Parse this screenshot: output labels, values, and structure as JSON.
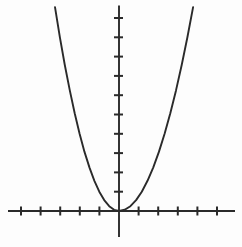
{
  "figure": {
    "background_color": "#fdfdfd",
    "line_color": "#2a2a2a"
  },
  "chart_data": {
    "type": "line",
    "title": "",
    "xlabel": "",
    "ylabel": "",
    "grid": false,
    "legend_shown": false,
    "tick_labels_shown": false,
    "function": "y = x^2",
    "xlim": [
      -5.7,
      5.9
    ],
    "ylim": [
      -1.35,
      10.65
    ],
    "x_ticks": [
      -5,
      -4,
      -3,
      -2,
      -1,
      1,
      2,
      3,
      4,
      5
    ],
    "y_ticks": [
      1,
      2,
      3,
      4,
      5,
      6,
      7,
      8,
      9,
      10
    ],
    "series": [
      {
        "name": "y = x^2",
        "points": [
          [
            -3.25,
            10.5625
          ],
          [
            -3.0,
            9.0
          ],
          [
            -2.75,
            7.5625
          ],
          [
            -2.5,
            6.25
          ],
          [
            -2.25,
            5.0625
          ],
          [
            -2.0,
            4.0
          ],
          [
            -1.75,
            3.0625
          ],
          [
            -1.5,
            2.25
          ],
          [
            -1.25,
            1.5625
          ],
          [
            -1.0,
            1.0
          ],
          [
            -0.75,
            0.5625
          ],
          [
            -0.5,
            0.25
          ],
          [
            -0.25,
            0.0625
          ],
          [
            0.0,
            0.0
          ],
          [
            0.25,
            0.0625
          ],
          [
            0.5,
            0.25
          ],
          [
            0.75,
            0.5625
          ],
          [
            1.0,
            1.0
          ],
          [
            1.25,
            1.5625
          ],
          [
            1.5,
            2.25
          ],
          [
            1.75,
            3.0625
          ],
          [
            2.0,
            4.0
          ],
          [
            2.25,
            5.0625
          ],
          [
            2.5,
            6.25
          ],
          [
            2.75,
            7.5625
          ],
          [
            3.0,
            9.0
          ],
          [
            3.25,
            10.5625
          ]
        ]
      }
    ]
  }
}
